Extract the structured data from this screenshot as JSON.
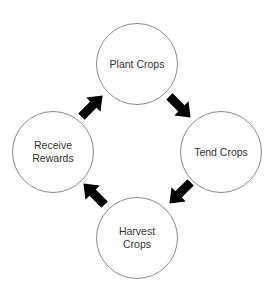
{
  "diagram": {
    "type": "cycle",
    "nodes": [
      {
        "id": "plant",
        "label": "Plant Crops"
      },
      {
        "id": "tend",
        "label": "Tend Crops"
      },
      {
        "id": "harvest",
        "label": "Harvest\nCrops"
      },
      {
        "id": "receive",
        "label": "Receive\nRewards"
      }
    ],
    "edges": [
      {
        "from": "plant",
        "to": "tend"
      },
      {
        "from": "tend",
        "to": "harvest"
      },
      {
        "from": "harvest",
        "to": "receive"
      },
      {
        "from": "receive",
        "to": "plant"
      }
    ],
    "colors": {
      "circle_stroke": "#8a8a8a",
      "arrow_fill": "#000000",
      "text": "#333333",
      "background": "#ffffff"
    }
  }
}
